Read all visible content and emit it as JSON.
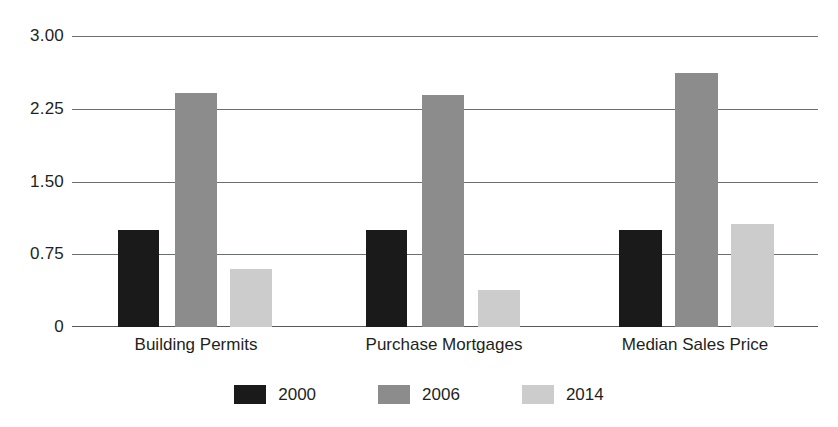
{
  "chart_data": {
    "type": "bar",
    "title": "",
    "subtitle": "",
    "xlabel": "",
    "ylabel": "",
    "categories": [
      "Building Permits",
      "Purchase Mortgages",
      "Median Sales Price"
    ],
    "series": [
      {
        "name": "2000",
        "color": "#1a1a1a",
        "values": [
          1.0,
          1.0,
          1.0
        ]
      },
      {
        "name": "2006",
        "color": "#8c8c8c",
        "values": [
          2.42,
          2.4,
          2.63
        ]
      },
      {
        "name": "2014",
        "color": "#cccccc",
        "values": [
          0.6,
          0.38,
          1.07
        ]
      }
    ],
    "y_ticks": [
      {
        "value": 3.0,
        "label": "3.00"
      },
      {
        "value": 2.25,
        "label": "2.25"
      },
      {
        "value": 1.5,
        "label": "1.50"
      },
      {
        "value": 0.75,
        "label": "0.75"
      },
      {
        "value": 0,
        "label": "0"
      }
    ],
    "ylim": [
      0,
      3.0
    ],
    "grid": true,
    "legend_position": "bottom",
    "annotations": []
  },
  "axis": {
    "tick_3_00": "3.00",
    "tick_2_25": "2.25",
    "tick_1_50": "1.50",
    "tick_0_75": "0.75",
    "tick_0": "0"
  },
  "categories": {
    "c0": "Building Permits",
    "c1": "Purchase Mortgages",
    "c2": "Median Sales Price"
  },
  "legend": {
    "item0": "2000",
    "item1": "2006",
    "item2": "2014"
  },
  "colors": {
    "series_2000": "#1a1a1a",
    "series_2006": "#8c8c8c",
    "series_2014": "#cccccc",
    "gridline": "#6d6e71",
    "text": "#231f20",
    "background": "#ffffff"
  }
}
